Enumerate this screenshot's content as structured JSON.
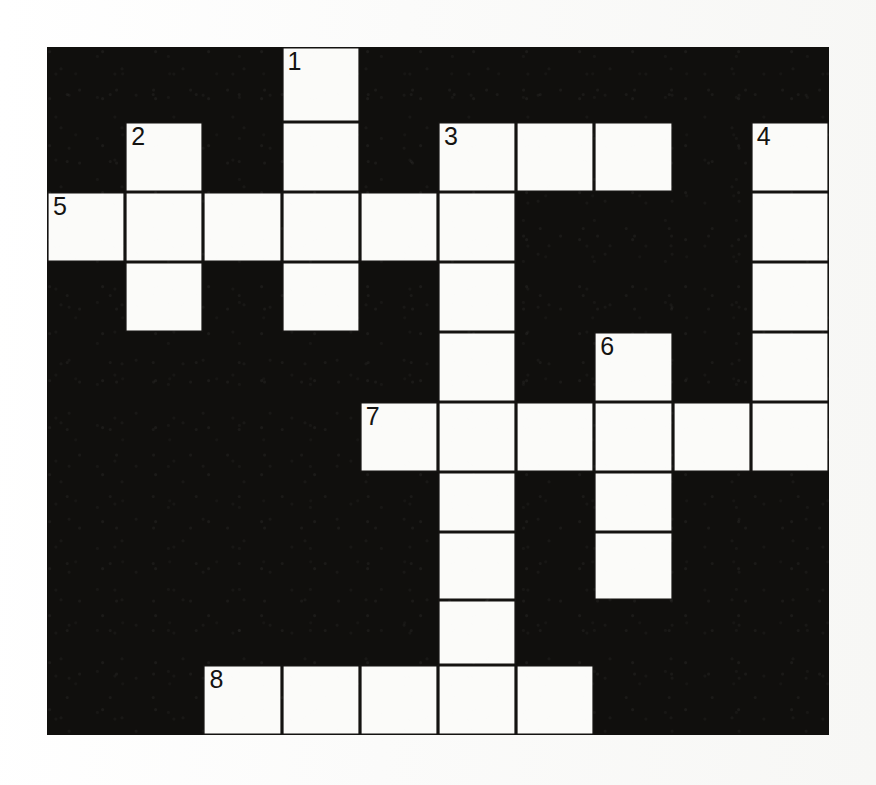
{
  "puzzle": {
    "kind": "crossword-grid",
    "columns": 10,
    "rows": 10,
    "colors": {
      "block": "#100f0d",
      "open_cell": "#fbfbf9",
      "grid_line": "#141311",
      "page": "#fdfdfc",
      "number_text": "#141311"
    },
    "clue_numbers": [
      "1",
      "2",
      "3",
      "4",
      "5",
      "6",
      "7",
      "8"
    ],
    "number_positions": {
      "1": {
        "row": 0,
        "col": 3
      },
      "2": {
        "row": 1,
        "col": 1
      },
      "3": {
        "row": 1,
        "col": 5
      },
      "4": {
        "row": 1,
        "col": 9
      },
      "5": {
        "row": 2,
        "col": 0
      },
      "6": {
        "row": 4,
        "col": 7
      },
      "7": {
        "row": 5,
        "col": 4
      },
      "8": {
        "row": 9,
        "col": 2
      }
    },
    "cells": [
      [
        {
          "open": false,
          "num": ""
        },
        {
          "open": false,
          "num": ""
        },
        {
          "open": false,
          "num": ""
        },
        {
          "open": true,
          "num": "1"
        },
        {
          "open": false,
          "num": ""
        },
        {
          "open": false,
          "num": ""
        },
        {
          "open": false,
          "num": ""
        },
        {
          "open": false,
          "num": ""
        },
        {
          "open": false,
          "num": ""
        },
        {
          "open": false,
          "num": ""
        }
      ],
      [
        {
          "open": false,
          "num": ""
        },
        {
          "open": true,
          "num": "2"
        },
        {
          "open": false,
          "num": ""
        },
        {
          "open": true,
          "num": ""
        },
        {
          "open": false,
          "num": ""
        },
        {
          "open": true,
          "num": "3"
        },
        {
          "open": true,
          "num": ""
        },
        {
          "open": true,
          "num": ""
        },
        {
          "open": false,
          "num": ""
        },
        {
          "open": true,
          "num": "4"
        }
      ],
      [
        {
          "open": true,
          "num": "5"
        },
        {
          "open": true,
          "num": ""
        },
        {
          "open": true,
          "num": ""
        },
        {
          "open": true,
          "num": ""
        },
        {
          "open": true,
          "num": ""
        },
        {
          "open": true,
          "num": ""
        },
        {
          "open": false,
          "num": ""
        },
        {
          "open": false,
          "num": ""
        },
        {
          "open": false,
          "num": ""
        },
        {
          "open": true,
          "num": ""
        }
      ],
      [
        {
          "open": false,
          "num": ""
        },
        {
          "open": true,
          "num": ""
        },
        {
          "open": false,
          "num": ""
        },
        {
          "open": true,
          "num": ""
        },
        {
          "open": false,
          "num": ""
        },
        {
          "open": true,
          "num": ""
        },
        {
          "open": false,
          "num": ""
        },
        {
          "open": false,
          "num": ""
        },
        {
          "open": false,
          "num": ""
        },
        {
          "open": true,
          "num": ""
        }
      ],
      [
        {
          "open": false,
          "num": ""
        },
        {
          "open": false,
          "num": ""
        },
        {
          "open": false,
          "num": ""
        },
        {
          "open": false,
          "num": ""
        },
        {
          "open": false,
          "num": ""
        },
        {
          "open": true,
          "num": ""
        },
        {
          "open": false,
          "num": ""
        },
        {
          "open": true,
          "num": "6"
        },
        {
          "open": false,
          "num": ""
        },
        {
          "open": true,
          "num": ""
        }
      ],
      [
        {
          "open": false,
          "num": ""
        },
        {
          "open": false,
          "num": ""
        },
        {
          "open": false,
          "num": ""
        },
        {
          "open": false,
          "num": ""
        },
        {
          "open": true,
          "num": "7"
        },
        {
          "open": true,
          "num": ""
        },
        {
          "open": true,
          "num": ""
        },
        {
          "open": true,
          "num": ""
        },
        {
          "open": true,
          "num": ""
        },
        {
          "open": true,
          "num": ""
        }
      ],
      [
        {
          "open": false,
          "num": ""
        },
        {
          "open": false,
          "num": ""
        },
        {
          "open": false,
          "num": ""
        },
        {
          "open": false,
          "num": ""
        },
        {
          "open": false,
          "num": ""
        },
        {
          "open": true,
          "num": ""
        },
        {
          "open": false,
          "num": ""
        },
        {
          "open": true,
          "num": ""
        },
        {
          "open": false,
          "num": ""
        },
        {
          "open": false,
          "num": ""
        }
      ],
      [
        {
          "open": false,
          "num": ""
        },
        {
          "open": false,
          "num": ""
        },
        {
          "open": false,
          "num": ""
        },
        {
          "open": false,
          "num": ""
        },
        {
          "open": false,
          "num": ""
        },
        {
          "open": true,
          "num": ""
        },
        {
          "open": false,
          "num": ""
        },
        {
          "open": true,
          "num": ""
        },
        {
          "open": false,
          "num": ""
        },
        {
          "open": false,
          "num": ""
        }
      ],
      [
        {
          "open": false,
          "num": ""
        },
        {
          "open": false,
          "num": ""
        },
        {
          "open": false,
          "num": ""
        },
        {
          "open": false,
          "num": ""
        },
        {
          "open": false,
          "num": ""
        },
        {
          "open": true,
          "num": ""
        },
        {
          "open": false,
          "num": ""
        },
        {
          "open": false,
          "num": ""
        },
        {
          "open": false,
          "num": ""
        },
        {
          "open": false,
          "num": ""
        }
      ],
      [
        {
          "open": false,
          "num": ""
        },
        {
          "open": false,
          "num": ""
        },
        {
          "open": true,
          "num": "8"
        },
        {
          "open": true,
          "num": ""
        },
        {
          "open": true,
          "num": ""
        },
        {
          "open": true,
          "num": ""
        },
        {
          "open": true,
          "num": ""
        },
        {
          "open": false,
          "num": ""
        },
        {
          "open": false,
          "num": ""
        },
        {
          "open": false,
          "num": ""
        }
      ]
    ]
  }
}
